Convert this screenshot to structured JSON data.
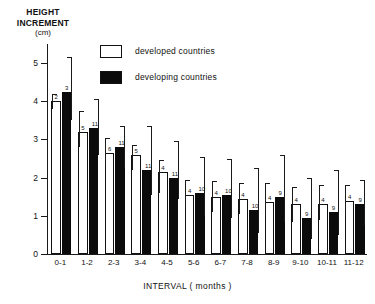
{
  "chart_data": {
    "type": "bar",
    "title": "",
    "ylabel_line1": "HEIGHT",
    "ylabel_line2": "INCREMENT",
    "ylabel_unit": "(cm)",
    "xlabel": "INTERVAL  ( months )",
    "categories": [
      "0-1",
      "1-2",
      "2-3",
      "3-4",
      "4-5",
      "5-6",
      "6-7",
      "7-8",
      "8-9",
      "9-10",
      "10-11",
      "11-12"
    ],
    "ylim": [
      0,
      5.5
    ],
    "yticks": [
      0,
      1,
      2,
      3,
      4,
      5
    ],
    "ytick_labels": [
      "0",
      "1",
      "2",
      "3",
      "4",
      "5"
    ],
    "grid": false,
    "legend_position": "top-right",
    "series": [
      {
        "name": "developed countries",
        "color": "#ffffff",
        "values": [
          4.0,
          3.2,
          2.65,
          2.6,
          2.15,
          1.55,
          1.5,
          1.45,
          1.35,
          1.3,
          1.3,
          1.4
        ],
        "n": [
          2,
          5,
          6,
          5,
          4,
          4,
          4,
          4,
          4,
          4,
          4,
          4
        ],
        "err_top": [
          4.2,
          3.75,
          3.05,
          2.85,
          2.45,
          1.95,
          1.9,
          1.85,
          1.85,
          1.75,
          1.8,
          1.8
        ],
        "err_bottom": [
          3.8,
          2.8,
          2.3,
          2.2,
          1.6,
          1.2,
          1.1,
          1.05,
          1.0,
          0.85,
          0.9,
          1.0
        ]
      },
      {
        "name": "developing countries",
        "color": "#0b0b0b",
        "values": [
          4.25,
          3.3,
          2.8,
          2.2,
          2.0,
          1.6,
          1.55,
          1.15,
          1.5,
          0.95,
          1.1,
          1.3
        ],
        "n": [
          3,
          11,
          11,
          11,
          11,
          10,
          10,
          10,
          9,
          9,
          9,
          9
        ],
        "err_top": [
          5.15,
          4.05,
          3.35,
          3.35,
          2.95,
          2.55,
          2.5,
          2.25,
          2.6,
          2.0,
          2.2,
          1.95
        ],
        "err_bottom": [
          3.5,
          2.6,
          2.25,
          1.55,
          1.45,
          1.0,
          0.95,
          0.55,
          0.85,
          0.4,
          0.5,
          0.75
        ]
      }
    ]
  },
  "legend": {
    "items": [
      {
        "label": "developed  countries",
        "swatch": "open"
      },
      {
        "label": "developing  countries",
        "swatch": "filled"
      }
    ]
  }
}
